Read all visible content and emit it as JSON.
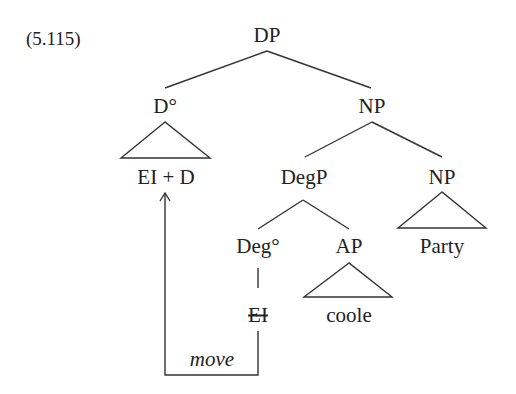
{
  "example_number": "(5.115)",
  "tree": {
    "root": "DP",
    "d_head": "D°",
    "d_content": "EI + D",
    "np": "NP",
    "degp": "DegP",
    "deg_head": "Deg°",
    "deg_trace": "EI",
    "ap": "AP",
    "ap_content": "coole",
    "np2": "NP",
    "np2_content": "Party",
    "movement_label": "move"
  }
}
